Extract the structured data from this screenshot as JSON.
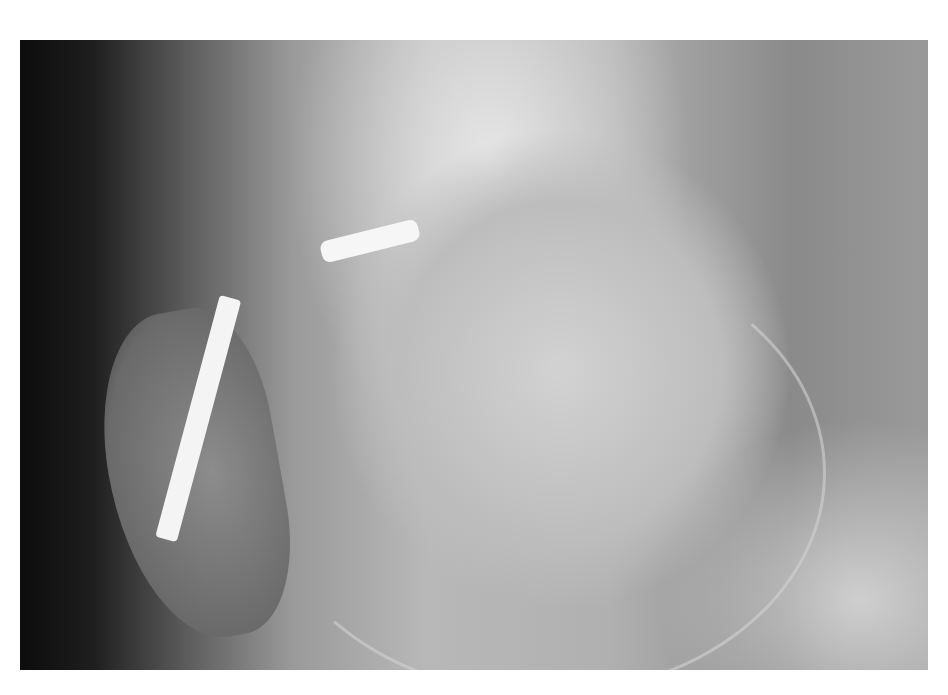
{
  "image": {
    "description": "Lateral knee X-ray radiograph showing femoral condyle, patella and a bright metallic pin/screw implant",
    "tones": {
      "dark": "#0c0c0c",
      "mid": "#9a9a9a",
      "bright": "#f4f4f4",
      "border": "#ffffff"
    }
  }
}
